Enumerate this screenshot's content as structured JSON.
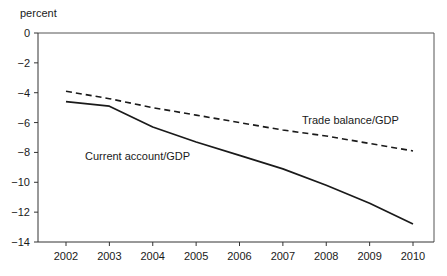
{
  "chart_data": {
    "type": "line",
    "title": "",
    "subtitle": "",
    "xlabel": "",
    "ylabel": "percent",
    "ylim": [
      -14,
      0
    ],
    "xlim": [
      2002,
      2010
    ],
    "grid": false,
    "legend_position": "inline-annotation",
    "categories": [
      2002,
      2003,
      2004,
      2005,
      2006,
      2007,
      2008,
      2009,
      2010
    ],
    "x_tick_labels": [
      "2002",
      "2003",
      "2004",
      "2005",
      "2006",
      "2007",
      "2008",
      "2009",
      "2010"
    ],
    "y_tick_labels": [
      "0",
      "−2",
      "−4",
      "−6",
      "−8",
      "−10",
      "−12",
      "−14"
    ],
    "y_tick_values": [
      0,
      -2,
      -4,
      -6,
      -8,
      -10,
      -12,
      -14
    ],
    "series": [
      {
        "name": "Current account/GDP",
        "style": "solid",
        "color": "#1a1a1a",
        "values": [
          -4.6,
          -4.9,
          -6.3,
          -7.3,
          -8.2,
          -9.1,
          -10.2,
          -11.4,
          -12.8
        ]
      },
      {
        "name": "Trade balance/GDP",
        "style": "dashed",
        "color": "#1a1a1a",
        "values": [
          -3.9,
          -4.4,
          -5.0,
          -5.5,
          -6.0,
          -6.5,
          -6.9,
          -7.4,
          -7.9
        ]
      }
    ],
    "annotations": [
      {
        "text": "Trade balance/GDP",
        "x_px": 302,
        "y_px": 124
      },
      {
        "text": "Current account/GDP",
        "x_px": 85,
        "y_px": 160
      }
    ]
  },
  "axes": {
    "unit_label": "percent"
  }
}
